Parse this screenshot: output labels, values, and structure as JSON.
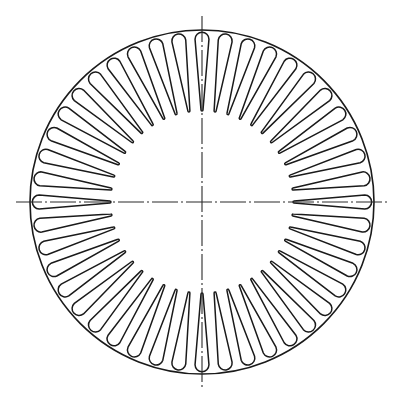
{
  "document": {
    "title": "Stator Lamination Cross-Section",
    "kind": "technical-drawing",
    "view": "plan-view",
    "background_color": "#ffffff",
    "line_color": "#1a1a1a"
  },
  "canvas": {
    "width": 396,
    "height": 404
  },
  "drawing": {
    "center_x": 202,
    "center_y": 202,
    "outer_radius": 172,
    "outline_stroke_width": 1.6,
    "slot_stroke_width": 1.5,
    "slot_fill": "#ffffff"
  },
  "slots": {
    "count": 44,
    "angular_pitch_deg": 8.1818,
    "start_angle_deg": 0,
    "outer_tip_radius": 163,
    "inner_tip_radius": 92,
    "outer_half_width_deg": 2.45,
    "inner_half_width_deg": 0.62,
    "shape": "tapered-wedge-rounded-ends",
    "description": "Radial tapered slots, wide rounded opening near rim, narrowing to rounded tip toward center"
  },
  "centerlines": {
    "style": "dash-dot",
    "stroke_width": 1.1,
    "color": "#2a2a2a",
    "dash_pattern": "26 3 2 3",
    "overhang": 14,
    "vertical": {
      "name": "vertical-centerline",
      "x1": 202,
      "y1": 16,
      "x2": 202,
      "y2": 388
    },
    "horizontal": {
      "name": "horizontal-centerline",
      "x1": 16,
      "y1": 202,
      "x2": 388,
      "y2": 202
    }
  },
  "labels": {
    "figure_caption": "",
    "dimensions": []
  }
}
